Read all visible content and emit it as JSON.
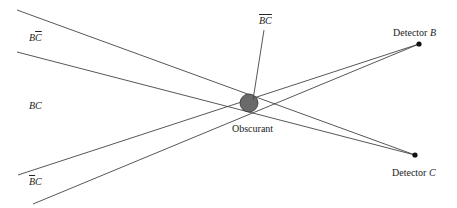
{
  "diagram": {
    "colors": {
      "line": "#444444",
      "obscurant_fill": "#6a6a6a",
      "detector": "#111111"
    },
    "detectors": [
      {
        "id": "B",
        "label_prefix": "Detector ",
        "label_var": "B",
        "x": 419,
        "y": 44
      },
      {
        "id": "C",
        "label_prefix": "Detector ",
        "label_var": "C",
        "x": 415,
        "y": 155
      }
    ],
    "obscurant": {
      "label": "Obscurant",
      "cx": 249,
      "cy": 103,
      "r": 9
    },
    "regions": [
      {
        "id": "B-notC",
        "b": "B",
        "c": "C",
        "b_bar": false,
        "c_bar": true
      },
      {
        "id": "BC",
        "b": "B",
        "c": "C",
        "b_bar": false,
        "c_bar": false
      },
      {
        "id": "notB-C",
        "b": "B",
        "c": "C",
        "b_bar": true,
        "c_bar": false
      },
      {
        "id": "notB-notC",
        "b": "B",
        "c": "C",
        "b_bar": true,
        "c_bar": true
      }
    ],
    "lines": [
      {
        "from": [
          17,
          10
        ],
        "to": [
          415,
          155
        ]
      },
      {
        "from": [
          17,
          52
        ],
        "to": [
          415,
          155
        ]
      },
      {
        "from": [
          18,
          175
        ],
        "to": [
          419,
          44
        ]
      },
      {
        "from": [
          33,
          204
        ],
        "to": [
          419,
          44
        ]
      },
      {
        "from": [
          264,
          30
        ],
        "to": [
          253,
          100
        ]
      }
    ]
  }
}
